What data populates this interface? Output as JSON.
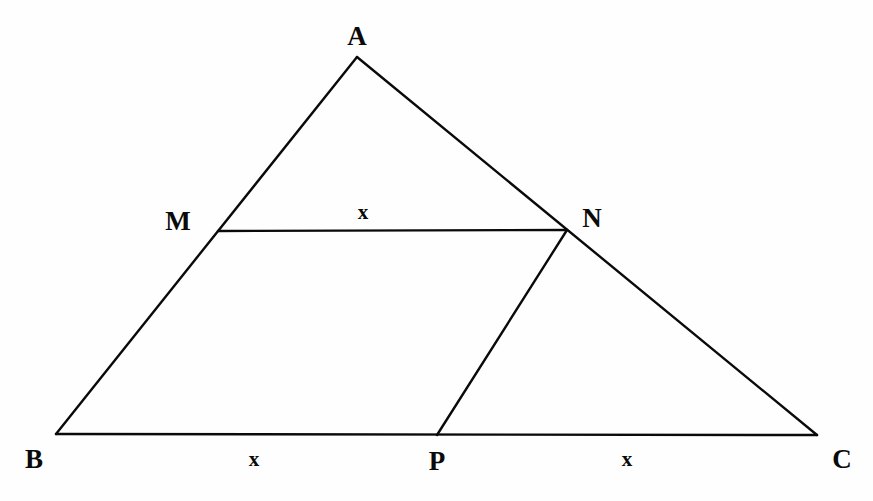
{
  "figure": {
    "canvas": {
      "width": 873,
      "height": 501
    },
    "background_color": "#fefefe",
    "stroke_color": "#0a0a0a",
    "stroke_width": 2.4
  },
  "points": {
    "A": {
      "label": "A",
      "x": 357,
      "y": 57,
      "label_x": 357,
      "label_y": 36
    },
    "B": {
      "label": "B",
      "x": 56,
      "y": 434,
      "label_x": 34,
      "label_y": 459
    },
    "C": {
      "label": "C",
      "x": 817,
      "y": 435,
      "label_x": 842,
      "label_y": 459
    },
    "M": {
      "label": "M",
      "x": 218,
      "y": 231,
      "label_x": 178,
      "label_y": 221
    },
    "N": {
      "label": "N",
      "x": 567,
      "y": 230,
      "label_x": 592,
      "label_y": 218
    },
    "P": {
      "label": "P",
      "x": 437,
      "y": 435,
      "label_x": 437,
      "label_y": 461
    }
  },
  "segments": [
    {
      "name": "side-AB",
      "from": "A",
      "to": "B"
    },
    {
      "name": "side-AC",
      "from": "A",
      "to": "C"
    },
    {
      "name": "side-BC",
      "from": "B",
      "to": "C"
    },
    {
      "name": "segment-MN",
      "from": "M",
      "to": "N"
    },
    {
      "name": "segment-PN",
      "from": "P",
      "to": "N"
    }
  ],
  "measures": [
    {
      "name": "length-MN",
      "label": "x",
      "x": 363,
      "y": 212,
      "on": "MN"
    },
    {
      "name": "length-BP",
      "label": "x",
      "x": 254,
      "y": 459,
      "on": "BP"
    },
    {
      "name": "length-PC",
      "label": "x",
      "x": 627,
      "y": 459,
      "on": "PC"
    }
  ],
  "chart_data": {
    "type": "diagram",
    "vertices": [
      {
        "id": "A",
        "x": 357,
        "y": 57
      },
      {
        "id": "B",
        "x": 56,
        "y": 434
      },
      {
        "id": "C",
        "x": 817,
        "y": 435
      },
      {
        "id": "M",
        "x": 218,
        "y": 231
      },
      {
        "id": "N",
        "x": 567,
        "y": 230
      },
      {
        "id": "P",
        "x": 437,
        "y": 435
      }
    ],
    "edges": [
      [
        "A",
        "B"
      ],
      [
        "A",
        "C"
      ],
      [
        "B",
        "C"
      ],
      [
        "M",
        "N"
      ],
      [
        "P",
        "N"
      ]
    ],
    "annotations": [
      "x",
      "x",
      "x"
    ]
  }
}
